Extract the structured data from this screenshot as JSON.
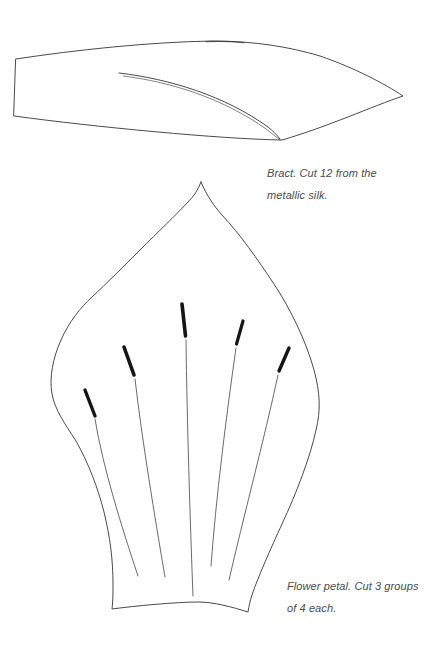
{
  "page": {
    "background": "#ffffff",
    "ink": "#4a4a4a",
    "emphasis": "#151515",
    "caption_color": "#4b4b4b"
  },
  "figures": {
    "bract": {
      "name": "bract-pattern",
      "caption": {
        "line1": "Bract. Cut 12 from the",
        "line2": "metallic silk."
      }
    },
    "petal": {
      "name": "flower-petal-pattern",
      "caption": {
        "line1": "Flower petal. Cut 3 groups",
        "line2": "of 4 each."
      }
    }
  }
}
